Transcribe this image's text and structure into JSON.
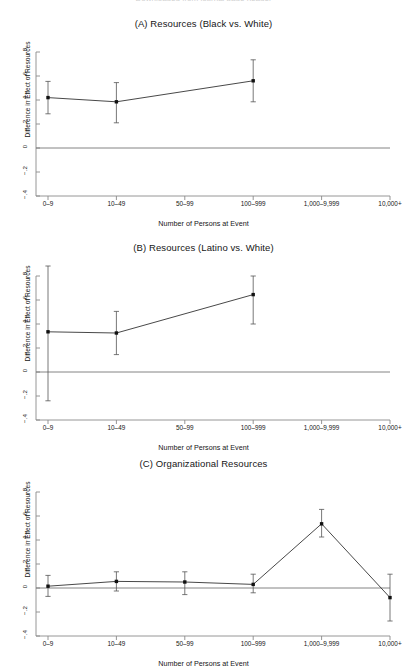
{
  "figure": {
    "cut_off_header": "Downloaded from journal page header",
    "xlabel": "Number of Persons at Event",
    "ylabel": "Difference in Effect of Resources",
    "line_color": "#333333",
    "marker_color": "#111111",
    "zero_line_color": "#777777",
    "axis_color": "#8a8a8a"
  },
  "chart_data": [
    {
      "type": "line",
      "panel": "A",
      "title": "(A) Resources (Black vs. White)",
      "xlabel": "Number of Persons at Event",
      "ylabel": "Difference in Effect of Resources",
      "categories": [
        "0–9",
        "10–49",
        "50–99",
        "100–999",
        "1,000–9,999",
        "10,000+"
      ],
      "yticks": [
        ".8",
        ".6",
        ".4",
        ".2",
        "0",
        "−.2",
        "−.4"
      ],
      "ytick_values": [
        0.8,
        0.6,
        0.4,
        0.2,
        0,
        -0.2,
        -0.4
      ],
      "ylim": [
        -0.45,
        0.85
      ],
      "grid": false,
      "legend": "none",
      "zero_reference_line": 0,
      "series": [
        {
          "name": "Black vs. White difference",
          "x": [
            "0–9",
            "10–49",
            "100–999"
          ],
          "values": [
            0.42,
            0.385,
            0.56
          ],
          "ci_low": [
            0.285,
            0.21,
            0.385
          ],
          "ci_high": [
            0.555,
            0.545,
            0.735
          ]
        }
      ]
    },
    {
      "type": "line",
      "panel": "B",
      "title": "(B) Resources (Latino vs. White)",
      "xlabel": "Number of Persons at Event",
      "ylabel": "Difference in Effect of Resources",
      "categories": [
        "0–9",
        "10–49",
        "50–99",
        "100–999",
        "1,000–9,999",
        "10,000+"
      ],
      "yticks": [
        ".8",
        ".6",
        ".4",
        ".2",
        "0",
        "−.2",
        "−.4"
      ],
      "ytick_values": [
        0.8,
        0.6,
        0.4,
        0.2,
        0,
        -0.2,
        -0.4
      ],
      "ylim": [
        -0.45,
        0.85
      ],
      "grid": false,
      "legend": "none",
      "zero_reference_line": 0,
      "series": [
        {
          "name": "Latino vs. White difference",
          "x": [
            "0–9",
            "10–49",
            "100–999"
          ],
          "values": [
            0.335,
            0.325,
            0.645
          ],
          "ci_low": [
            -0.24,
            0.145,
            0.4
          ],
          "ci_high": [
            0.92,
            0.505,
            0.8
          ]
        }
      ]
    },
    {
      "type": "line",
      "panel": "C",
      "title": "(C) Organizational Resources",
      "xlabel": "Number of Persons at Event",
      "ylabel": "Difference in Effect of Resources",
      "categories": [
        "0–9",
        "10–49",
        "50–99",
        "100–999",
        "1,000–9,999",
        "10,000+"
      ],
      "yticks": [
        ".8",
        ".6",
        ".4",
        ".2",
        "0",
        "−.2",
        "−.4"
      ],
      "ytick_values": [
        0.8,
        0.6,
        0.4,
        0.2,
        0,
        -0.2,
        -0.4
      ],
      "ylim": [
        -0.45,
        0.85
      ],
      "grid": false,
      "legend": "none",
      "zero_reference_line": 0,
      "series": [
        {
          "name": "Organizational resources difference",
          "x": [
            "0–9",
            "10–49",
            "50–99",
            "100–999",
            "1,000–9,999",
            "10,000+"
          ],
          "values": [
            0.015,
            0.055,
            0.05,
            0.03,
            0.535,
            -0.08
          ],
          "ci_low": [
            -0.07,
            -0.025,
            -0.055,
            -0.04,
            0.425,
            -0.275
          ],
          "ci_high": [
            0.105,
            0.135,
            0.135,
            0.115,
            0.655,
            0.115
          ]
        }
      ]
    }
  ]
}
